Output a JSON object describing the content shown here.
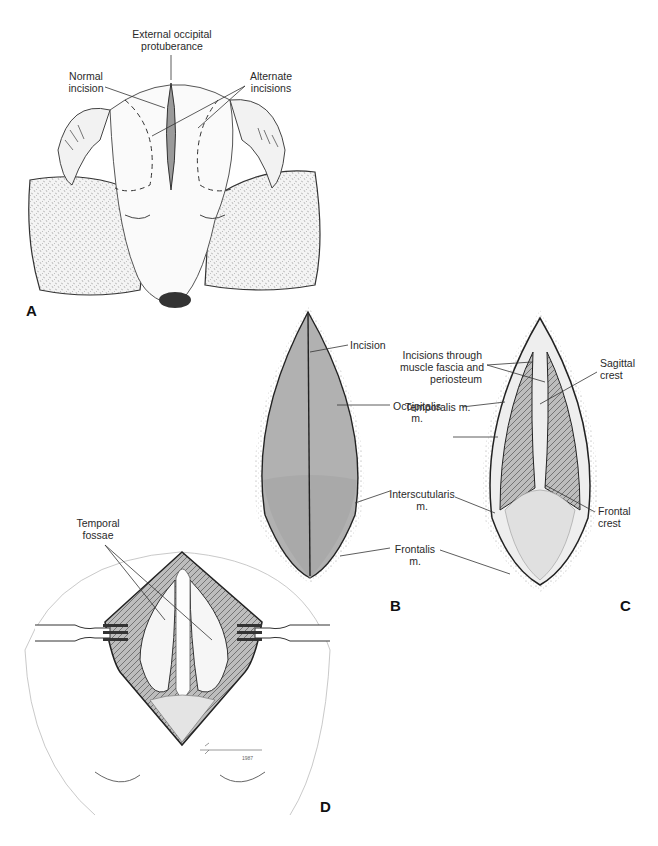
{
  "figure": {
    "panels": [
      {
        "id": "A",
        "letter": "A",
        "labels": {
          "ext_occ_line1": "External occipital",
          "ext_occ_line2": "protuberance",
          "normal_line1": "Normal",
          "normal_line2": "incision",
          "alt_line1": "Alternate",
          "alt_line2": "incisions"
        }
      },
      {
        "id": "B",
        "letter": "B",
        "labels": {
          "incision": "Incision",
          "occipitalis_line1": "Occipitalis",
          "occipitalis_line2": "m.",
          "interscutularis_line1": "Interscutularis",
          "interscutularis_line2": "m.",
          "frontalis_line1": "Frontalis",
          "frontalis_line2": "m."
        }
      },
      {
        "id": "C",
        "letter": "C",
        "labels": {
          "incisions_line1": "Incisions through",
          "incisions_line2": "muscle fascia and",
          "incisions_line3": "periosteum",
          "temporalis": "Temporalis m.",
          "sagittal_line1": "Sagittal",
          "sagittal_line2": "crest",
          "frontal_line1": "Frontal",
          "frontal_line2": "crest"
        }
      },
      {
        "id": "D",
        "letter": "D",
        "labels": {
          "temporal_line1": "Temporal",
          "temporal_line2": "fossae"
        },
        "signature_year": "1987"
      }
    ],
    "colors": {
      "ink": "#222222",
      "shade": "#8a8a8a",
      "light": "#d8d8d8",
      "background": "#ffffff"
    }
  }
}
